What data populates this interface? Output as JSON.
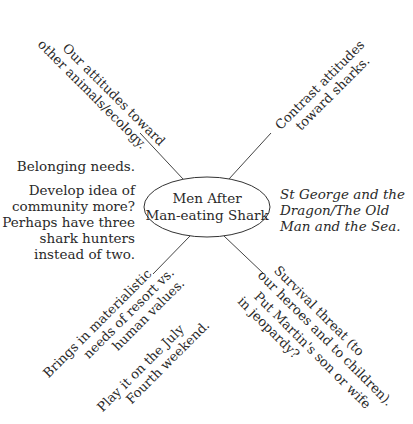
{
  "diagram": {
    "type": "mind-map",
    "center": {
      "lines": [
        "Men After",
        "Man-eating Shark"
      ]
    },
    "branches": {
      "upper_left": [
        "Our attitudes toward",
        "other animals/ecology."
      ],
      "upper_right": [
        "Contrast attitudes",
        "toward sharks."
      ],
      "lower_left": {
        "group1": [
          "Brings in materialistic",
          "needs of resort vs.",
          "human values."
        ],
        "group2": [
          "Play it on the July",
          "Fourth weekend."
        ]
      },
      "lower_right": {
        "group1": [
          "Survival threat (to",
          "our heroes and to children)."
        ],
        "group2": [
          "Put Martin's son or wife",
          "in jeopardy?"
        ]
      }
    },
    "side_notes": {
      "left": {
        "note1": "Belonging needs.",
        "note2": [
          "Develop idea of",
          "community more?",
          "Perhaps have three",
          "shark hunters",
          "instead of two."
        ]
      },
      "right": [
        "St George and the",
        "Dragon/The Old",
        "Man and the Sea."
      ]
    }
  }
}
